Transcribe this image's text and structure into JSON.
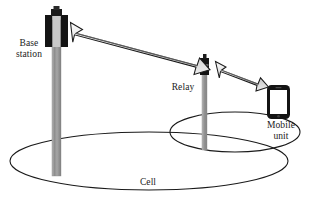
{
  "diagram": {
    "type": "network-topology",
    "background_color": "#ffffff",
    "line_color": "#1a1a1a",
    "nodes": [
      {
        "id": "base-station",
        "label_lines": [
          "Base",
          "station"
        ],
        "label": "Base station",
        "icon": "cell-tower",
        "mast_color": "#9a9a9a",
        "antenna_color": "#141414"
      },
      {
        "id": "relay",
        "label_lines": [
          "Relay"
        ],
        "label": "Relay",
        "icon": "relay-pole",
        "mast_color": "#9a9a9a",
        "antenna_color": "#141414"
      },
      {
        "id": "mobile-unit",
        "label_lines": [
          "Mobile",
          "unit"
        ],
        "label": "Mobile unit",
        "icon": "smartphone",
        "body_color": "#141414",
        "screen_color": "#ffffff"
      }
    ],
    "links": [
      {
        "id": "link-base-relay",
        "from": "base-station",
        "to": "relay",
        "style": "double-headed-block-arrow",
        "fill": "#d9d9d9",
        "stroke": "#1a1a1a"
      },
      {
        "id": "link-relay-mobile",
        "from": "relay",
        "to": "mobile-unit",
        "style": "double-headed-block-arrow",
        "fill": "#d9d9d9",
        "stroke": "#1a1a1a"
      }
    ],
    "regions": [
      {
        "id": "cell-area",
        "label": "Cell",
        "shape": "ellipse",
        "fill": "none",
        "stroke": "#1a1a1a"
      },
      {
        "id": "relay-area",
        "label": "",
        "shape": "ellipse",
        "fill": "none",
        "stroke": "#1a1a1a"
      }
    ]
  },
  "labels": {
    "base_station_line1": "Base",
    "base_station_line2": "station",
    "relay": "Relay",
    "mobile_unit_line1": "Mobile",
    "mobile_unit_line2": "unit",
    "cell": "Cell"
  }
}
